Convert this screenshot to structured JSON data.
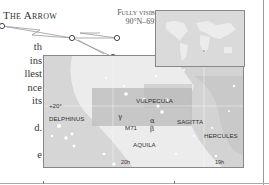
{
  "header": {
    "title": "The Arrow",
    "visibility_line1": "Fully visible",
    "visibility_line2": "90°N–69°S"
  },
  "body_text_fragments": [
    "th",
    "ins",
    "llest",
    "nce",
    "its",
    "",
    "d.",
    "",
    "e"
  ],
  "map": {
    "constellations": [
      {
        "name": "DELPHINUS"
      },
      {
        "name": "VULPECULA"
      },
      {
        "name": "SAGITTA"
      },
      {
        "name": "AQUILA"
      },
      {
        "name": "HERCULES"
      }
    ],
    "stars": [
      {
        "label": "γ"
      },
      {
        "label": "α"
      },
      {
        "label": "β"
      }
    ],
    "objects": [
      {
        "label": "M71"
      }
    ],
    "declination_label": "+20°",
    "ra_labels": [
      "20h",
      "19h"
    ]
  },
  "colors": {
    "background": "#ffffff",
    "sky_light": "#ececec",
    "milky_way": "#d0d0d0",
    "highlight_box": "#bdbdbd",
    "border": "#888888"
  }
}
